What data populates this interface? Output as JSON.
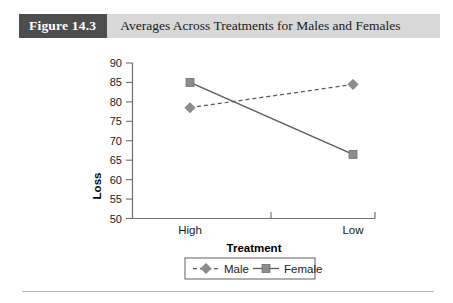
{
  "figure": {
    "badge_label": "Figure 14.3",
    "caption": "Averages Across Treatments for Males and Females"
  },
  "chart_data": {
    "type": "line",
    "title": "Averages Across Treatments for Males and Females",
    "xlabel": "Treatment",
    "ylabel": "Loss",
    "categories": [
      "High",
      "Low"
    ],
    "ylim": [
      50,
      90
    ],
    "yticks": [
      50,
      55,
      60,
      65,
      70,
      75,
      80,
      85,
      90
    ],
    "ytick_labels": [
      "50",
      "55",
      "60",
      "65",
      "70",
      "75",
      "80",
      "85",
      "90"
    ],
    "grid": false,
    "legend_position": "bottom-center",
    "series": [
      {
        "name": "Male",
        "values": [
          78.5,
          84.5
        ],
        "marker": "diamond",
        "linestyle": "dashed",
        "color": "#8d8d8d"
      },
      {
        "name": "Female",
        "values": [
          85.0,
          66.5
        ],
        "marker": "square",
        "linestyle": "solid",
        "color": "#8d8d8d"
      }
    ]
  },
  "colors": {
    "badge_background": "#4d4d4d",
    "header_band": "#d8d8d8",
    "series_gray": "#8d8d8d",
    "axis_gray": "#6e6e6e"
  }
}
